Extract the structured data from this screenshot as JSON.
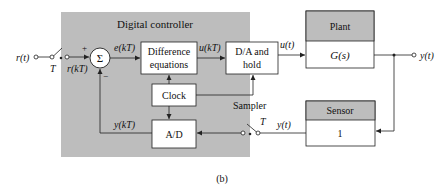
{
  "diagram": {
    "caption": "(b)",
    "controller_panel": {
      "title": "Digital controller",
      "fill": "#bdbdbd"
    },
    "blocks": {
      "difference_equations": {
        "line1": "Difference",
        "line2": "equations"
      },
      "da_hold": {
        "line1": "D/A and",
        "line2": "hold"
      },
      "clock": {
        "label": "Clock"
      },
      "ad": {
        "label": "A/D"
      },
      "plant": {
        "header": "Plant",
        "body": "G(s)",
        "header_fill": "#bdbdbd"
      },
      "sensor": {
        "header": "Sensor",
        "body": "1",
        "header_fill": "#bdbdbd"
      }
    },
    "summing_junction": {
      "symbol": "Σ",
      "plus": "+",
      "minus": "−"
    },
    "signals": {
      "input": "r(t)",
      "input_sampled": "r(kT)",
      "error": "e(kT)",
      "control_discrete": "u(kT)",
      "control_continuous": "u(t)",
      "output": "y(t)",
      "feedback_continuous": "y(t)",
      "feedback_discrete": "y(kT)"
    },
    "input_switch": {
      "period_label": "T"
    },
    "sampler": {
      "label": "Sampler",
      "period_label": "T"
    }
  }
}
